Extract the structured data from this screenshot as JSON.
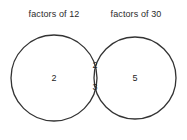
{
  "figure": {
    "type": "venn-diagram",
    "stroke_color": "#333333",
    "background_color": "#ffffff",
    "text_color": "#1e1e1e",
    "left_set": {
      "label": "factors of 12",
      "only_values": "2"
    },
    "right_set": {
      "label": "factors of 30",
      "only_values": "5"
    },
    "intersection": {
      "first_value": "2",
      "second_value": "3"
    }
  }
}
